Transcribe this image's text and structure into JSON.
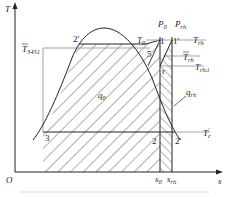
{
  "diagram": {
    "type": "T-s diagram (reheat cycle)",
    "axes": {
      "y_label": "T",
      "x_label": "s",
      "origin_label": "O"
    },
    "points": [
      {
        "id": "1",
        "label": "1"
      },
      {
        "id": "1p",
        "label": "1'"
      },
      {
        "id": "2",
        "label": "2"
      },
      {
        "id": "2p",
        "label": "2'"
      },
      {
        "id": "3",
        "label": "3"
      },
      {
        "id": "4",
        "label": "4"
      },
      {
        "id": "5",
        "label": "5"
      }
    ],
    "labels": {
      "p0_main": "P",
      "p0_sub": "0",
      "prh_main": "P",
      "prh_sub": "rh",
      "t0_main": "T",
      "t0_sub": "0",
      "trh_main": "T",
      "trh_sub": "rh",
      "trh_bar_main": "T",
      "trh_bar_sub": "rh",
      "trhi_main": "T",
      "trhi_sub": "rh.i",
      "t3451_main": "T",
      "t3451_sub": "3451",
      "q0_main": "q",
      "q0_sub": "0",
      "qrh_main": "q",
      "qrh_sub": "rh",
      "tc_main": "T",
      "tc_sub": "c",
      "tc_sup": "'",
      "s0_main": "s",
      "s0_sub": "0",
      "srh_main": "s",
      "srh_sub": "rh"
    }
  }
}
